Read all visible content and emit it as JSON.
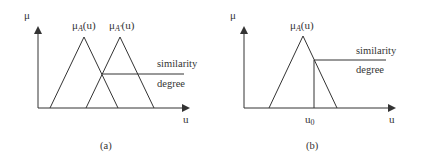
{
  "panels": [
    {
      "id": "a",
      "caption": "(a)",
      "y_axis_label": "μ",
      "x_axis_label": "u",
      "curves": [
        {
          "label_main": "μ",
          "label_sub": "A",
          "label_suffix": "(u)",
          "base": [
            50,
            118
          ],
          "apex": [
            84,
            37
          ]
        },
        {
          "label_main": "μ",
          "label_sub": "A'",
          "label_suffix": "(u)",
          "base": [
            86,
            154
          ],
          "apex": [
            120,
            37
          ]
        }
      ],
      "annotation_top": "similarity",
      "annotation_bottom": "degree"
    },
    {
      "id": "b",
      "caption": "(b)",
      "y_axis_label": "μ",
      "x_axis_label": "u",
      "curves": [
        {
          "label_main": "μ",
          "label_sub": "A",
          "label_suffix": "(u)",
          "base": [
            269,
            337
          ],
          "apex": [
            303,
            36
          ]
        }
      ],
      "marker_label_main": "u",
      "marker_label_sub": "0",
      "annotation_top": "similarity",
      "annotation_bottom": "degree"
    }
  ],
  "colors": {
    "line": "#333333",
    "background": "#ffffff"
  }
}
